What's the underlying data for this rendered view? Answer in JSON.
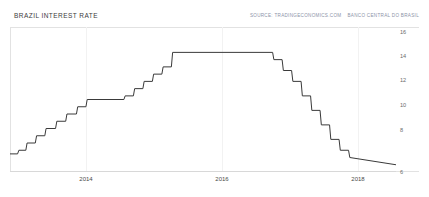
{
  "header": {
    "title": "BRAZIL INTEREST RATE",
    "source_prefix": "SOURCE: TRADINGECONOMICS.COM",
    "source_suffix": "BANCO CENTRAL DO BRASIL"
  },
  "colors": {
    "line": "#3a3a3a",
    "frame": "#e2e2e2",
    "title_text": "#3c3c3c",
    "source_text": "#8c93a8",
    "tick_text": "#6b6b6b",
    "background": "#ffffff"
  },
  "chart_data": {
    "type": "line",
    "title": "BRAZIL INTEREST RATE",
    "xlabel": "",
    "ylabel": "",
    "ylim": [
      6,
      16
    ],
    "xlim": [
      2013.0,
      2019.1
    ],
    "grid": false,
    "legend": false,
    "y_ticks": [
      16,
      14,
      12,
      10,
      8,
      6
    ],
    "x_ticks": [
      2014,
      2016,
      2018
    ],
    "x_tick_labels": [
      "2014",
      "2016",
      "2018"
    ],
    "series": [
      {
        "name": "Selic Interest Rate",
        "x": [
          2013.0,
          2013.12,
          2013.14,
          2013.25,
          2013.27,
          2013.4,
          2013.42,
          2013.55,
          2013.57,
          2013.72,
          2013.74,
          2013.88,
          2013.9,
          2014.05,
          2014.07,
          2014.2,
          2014.22,
          2014.8,
          2014.82,
          2014.95,
          2014.97,
          2015.1,
          2015.12,
          2015.25,
          2015.27,
          2015.4,
          2015.42,
          2015.55,
          2015.57,
          2017.15,
          2017.17,
          2017.3,
          2017.32,
          2017.45,
          2017.47,
          2017.6,
          2017.62,
          2017.75,
          2017.77,
          2017.9,
          2017.92,
          2018.05,
          2018.07,
          2018.2,
          2018.22,
          2018.35,
          2018.37,
          2019.1
        ],
        "y": [
          7.25,
          7.25,
          7.5,
          7.5,
          8.0,
          8.0,
          8.5,
          8.5,
          9.0,
          9.0,
          9.5,
          9.5,
          10.0,
          10.0,
          10.5,
          10.5,
          11.0,
          11.0,
          11.25,
          11.25,
          11.75,
          11.75,
          12.25,
          12.25,
          12.75,
          12.75,
          13.25,
          13.25,
          14.25,
          14.25,
          13.75,
          13.75,
          13.0,
          13.0,
          12.25,
          12.25,
          11.25,
          11.25,
          10.25,
          10.25,
          9.25,
          9.25,
          8.25,
          8.25,
          7.5,
          7.5,
          7.0,
          6.5
        ],
        "color": "#3a3a3a"
      }
    ]
  }
}
